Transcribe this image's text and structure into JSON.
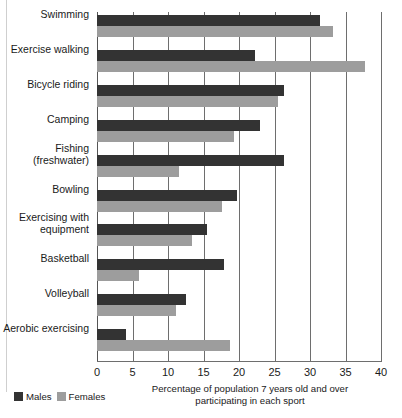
{
  "chart_data": {
    "type": "bar",
    "orientation": "horizontal",
    "title": "",
    "subtitle": "",
    "xlabel": "Percentage of population 7 years old and over participating in each sport",
    "xlabel_line1": "Percentage of population 7 years old and over",
    "xlabel_line2": "participating in each sport",
    "ylabel": "",
    "xlim": [
      0,
      40
    ],
    "xticks": [
      0,
      5,
      10,
      15,
      20,
      25,
      30,
      35,
      40
    ],
    "xtick_labels": [
      "0",
      "5",
      "10",
      "15",
      "20",
      "25",
      "30",
      "35",
      "40"
    ],
    "grid": true,
    "grid_axis": "x",
    "legend_position": "bottom-left",
    "categories": [
      "Swimming",
      "Exercise walking",
      "Bicycle riding",
      "Camping",
      "Fishing\n(freshwater)",
      "Bowling",
      "Exercising with\nequipment",
      "Basketball",
      "Volleyball",
      "Aerobic exercising"
    ],
    "series": [
      {
        "name": "Males",
        "color": "#333333",
        "values": [
          31.4,
          22.3,
          26.4,
          23.0,
          26.3,
          19.7,
          15.5,
          17.9,
          12.5,
          4.1
        ]
      },
      {
        "name": "Females",
        "color": "#9d9d9d",
        "values": [
          33.2,
          37.8,
          25.5,
          19.3,
          11.5,
          17.6,
          13.4,
          5.9,
          11.1,
          18.7
        ]
      }
    ]
  },
  "legend": {
    "items": [
      {
        "label": "Males",
        "color": "#333333"
      },
      {
        "label": "Females",
        "color": "#9d9d9d"
      }
    ]
  }
}
